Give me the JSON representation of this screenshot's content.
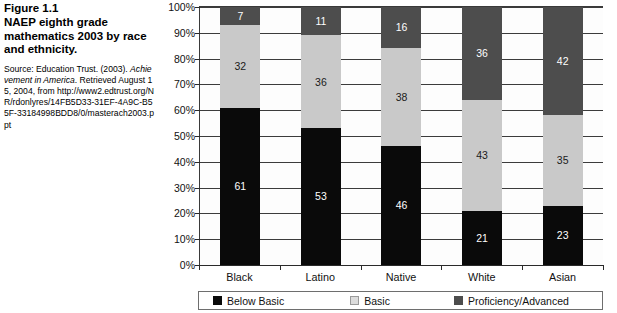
{
  "figure": {
    "number": "Figure 1.1",
    "title": "NAEP eighth grade mathematics 2003 by race and ethnicity.",
    "source_prefix": "Source: Education Trust. (2003). ",
    "source_italic": "Achievement in America",
    "source_suffix": ". Retrieved August 15, 2004, from http://www2.edtrust.org/NR/rdonlyres/14FB5D33-31EF-4A9C-B55F-33184998BDD8/0/masterach2003.ppt"
  },
  "chart_data": {
    "type": "bar",
    "stacked": true,
    "title": "NAEP eighth grade mathematics 2003 by race and ethnicity.",
    "xlabel": "",
    "ylabel": "",
    "ylim": [
      0,
      100
    ],
    "yticks": [
      "0%",
      "10%",
      "20%",
      "30%",
      "40%",
      "50%",
      "60%",
      "70%",
      "80%",
      "90%",
      "100%"
    ],
    "ytick_values": [
      0,
      10,
      20,
      30,
      40,
      50,
      60,
      70,
      80,
      90,
      100
    ],
    "grid": true,
    "legend_position": "bottom",
    "categories": [
      "Black",
      "Latino",
      "Native",
      "White",
      "Asian"
    ],
    "series": [
      {
        "name": "Below Basic",
        "color": "#0a0a0a",
        "values": [
          61,
          53,
          46,
          21,
          23
        ]
      },
      {
        "name": "Basic",
        "color": "#c9c9c9",
        "values": [
          32,
          36,
          38,
          43,
          35
        ]
      },
      {
        "name": "Proficiency/Advanced",
        "color": "#4d4d4d",
        "values": [
          7,
          11,
          16,
          36,
          42
        ]
      }
    ]
  }
}
